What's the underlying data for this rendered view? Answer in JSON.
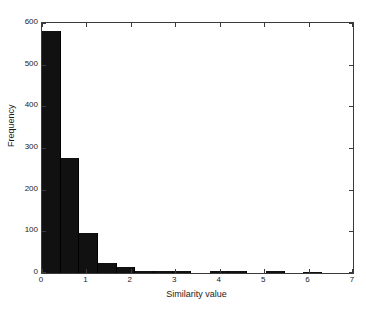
{
  "chart_data": {
    "type": "bar",
    "title": "",
    "subtitle": "",
    "xlabel": "Similarity value",
    "ylabel": "Frequency",
    "xlim": [
      0,
      7
    ],
    "ylim": [
      0,
      600
    ],
    "grid": false,
    "legend": null,
    "bar_color": "#111111",
    "axis_color": "#3a3a3a",
    "bin_width": 0.42,
    "bin_starts": [
      0.0,
      0.42,
      0.84,
      1.26,
      1.68,
      2.1,
      2.52,
      2.94,
      3.36,
      3.78,
      4.2,
      4.62,
      5.04,
      5.46,
      5.88,
      6.3
    ],
    "bin_centers": [
      0.21,
      0.63,
      1.05,
      1.47,
      1.89,
      2.31,
      2.73,
      3.15,
      3.57,
      3.99,
      4.41,
      4.83,
      5.25,
      5.67,
      6.09,
      6.51
    ],
    "values": [
      580,
      276,
      96,
      25,
      15,
      6,
      4,
      4,
      0,
      5,
      4,
      0,
      5,
      0,
      3,
      0
    ],
    "categories": [
      "0.00-0.42",
      "0.42-0.84",
      "0.84-1.26",
      "1.26-1.68",
      "1.68-2.10",
      "2.10-2.52",
      "2.52-2.94",
      "2.94-3.36",
      "3.36-3.78",
      "3.78-4.20",
      "4.20-4.62",
      "4.62-5.04",
      "5.04-5.46",
      "5.46-5.88",
      "5.88-6.30",
      "6.30-6.72"
    ],
    "xticks": [
      0,
      1,
      2,
      3,
      4,
      5,
      6,
      7
    ],
    "xtick_labels": [
      "0",
      "1",
      "2",
      "3",
      "4",
      "5",
      "6",
      "7"
    ],
    "yticks": [
      0,
      100,
      200,
      300,
      400,
      500,
      600
    ],
    "ytick_labels": [
      "0",
      "100",
      "200",
      "300",
      "400",
      "500",
      "600"
    ]
  }
}
